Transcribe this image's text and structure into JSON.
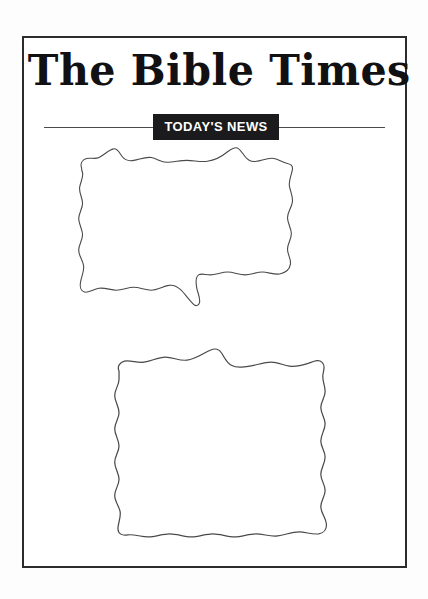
{
  "page": {
    "background_color": "#ffffff",
    "frame_color": "#2c2c2e",
    "width": 428,
    "height": 599
  },
  "masthead": {
    "title": "The Bible Times",
    "title_color": "#111114",
    "font_style": "blackletter"
  },
  "banner": {
    "label": "TODAY'S NEWS",
    "background_color": "#1b1b1d",
    "text_color": "#ffffff",
    "rule_color": "#4a4a4e"
  },
  "articles": [
    {
      "name": "article-block-1",
      "shape": "torn-paper",
      "content": "",
      "outline_color": "#4a4a4e",
      "fill_color": "#ffffff",
      "path": "M 12,22 C 10,16 14,13 17,12 C 22,11 26,13 30,11 C 36,8 40,3 45,2 C 49,1 51,6 54,10 C 57,14 61,15 66,14 C 72,13 78,10 84,11 C 90,12 94,16 100,16 C 107,16 114,14 121,14 C 128,14 135,16 142,15 C 150,14 157,10 163,5 C 167,2 170,0 173,1 C 176,2 178,6 181,10 C 184,14 188,16 193,15 C 199,14 205,11 211,12 C 216,13 219,16 224,17 C 228,18 231,19 230,24 C 229,30 226,35 227,41 C 228,47 231,52 230,58 C 229,64 225,68 225,74 C 225,80 229,85 229,91 C 229,97 225,101 225,107 C 225,113 229,117 228,123 C 227,129 222,132 217,133 C 211,134 205,131 199,131 C 193,131 187,134 181,134 C 175,134 169,131 163,131 C 157,131 151,134 145,134 C 140,134 136,132 133,134 C 130,136 130,141 131,147 C 132,153 135,158 134,163 C 133,167 130,167 127,164 C 123,160 119,154 115,150 C 111,146 107,144 102,145 C 96,146 90,150 84,150 C 78,150 72,147 66,147 C 60,147 54,150 48,150 C 42,150 36,147 30,148 C 24,149 19,153 15,152 C 11,151 10,146 11,141 C 12,135 15,130 14,124 C 13,118 9,114 9,108 C 9,102 13,98 13,92 C 13,86 9,81 9,75 C 9,69 13,65 13,59 C 13,53 9,48 10,42 C 11,36 14,32 13,27 C 12,25 12,23 12,22 Z"
    },
    {
      "name": "article-block-2",
      "shape": "torn-paper",
      "content": "",
      "outline_color": "#4a4a4e",
      "fill_color": "#ffffff",
      "path": "M 13,22 C 11,17 14,13 18,12 C 24,11 30,14 36,13 C 43,12 49,8 56,8 C 63,8 69,12 76,11 C 84,10 91,4 98,1 C 102,-1 106,0 108,4 C 111,9 113,14 117,16 C 122,19 128,18 134,17 C 141,16 147,13 154,13 C 160,13 165,16 171,17 C 177,18 183,16 189,14 C 194,12 198,10 201,13 C 204,16 203,20 202,25 C 201,31 204,36 204,42 C 204,48 200,52 200,58 C 200,64 204,68 204,74 C 204,80 200,85 200,91 C 200,97 204,101 204,107 C 204,113 200,118 200,124 C 200,130 204,134 204,140 C 204,146 200,150 200,156 C 200,162 204,166 205,172 C 206,178 203,182 198,183 C 192,184 186,181 180,181 C 173,181 167,184 160,185 C 153,186 147,183 140,183 C 133,183 127,186 120,186 C 113,186 107,183 100,183 C 93,183 87,186 80,186 C 73,186 67,183 60,183 C 53,183 47,186 40,186 C 33,186 27,183 21,184 C 16,185 12,183 12,178 C 12,172 15,167 14,161 C 13,155 9,151 9,145 C 9,139 13,135 13,129 C 13,123 9,118 9,112 C 9,106 13,102 13,96 C 13,90 9,85 9,79 C 9,73 13,69 13,63 C 13,57 9,52 9,46 C 9,40 13,36 13,30 C 13,27 13,24 13,22 Z"
    }
  ]
}
